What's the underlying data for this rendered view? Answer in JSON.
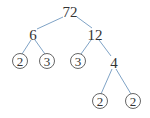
{
  "diagram": {
    "type": "factor-tree",
    "colors": {
      "edge": "#7fa3c6",
      "text": "#333333",
      "circle_stroke": "#555555"
    },
    "nodes": [
      {
        "id": "n72",
        "label": "72",
        "x": 70,
        "y": 11,
        "circled": false
      },
      {
        "id": "n6",
        "label": "6",
        "x": 33,
        "y": 34,
        "circled": false
      },
      {
        "id": "n12",
        "label": "12",
        "x": 95,
        "y": 34,
        "circled": false
      },
      {
        "id": "n2a",
        "label": "2",
        "x": 20,
        "y": 61,
        "circled": true
      },
      {
        "id": "n3a",
        "label": "3",
        "x": 47,
        "y": 61,
        "circled": true
      },
      {
        "id": "n3b",
        "label": "3",
        "x": 78,
        "y": 61,
        "circled": true
      },
      {
        "id": "n4",
        "label": "4",
        "x": 114,
        "y": 62,
        "circled": false
      },
      {
        "id": "n2b",
        "label": "2",
        "x": 100,
        "y": 101,
        "circled": true
      },
      {
        "id": "n2c",
        "label": "2",
        "x": 133,
        "y": 101,
        "circled": true
      }
    ],
    "edges": [
      {
        "from": "n72",
        "to": "n6",
        "x1": 63,
        "y1": 17,
        "x2": 37,
        "y2": 29
      },
      {
        "from": "n72",
        "to": "n12",
        "x1": 77,
        "y1": 17,
        "x2": 92,
        "y2": 28
      },
      {
        "from": "n6",
        "to": "n2a",
        "x1": 31,
        "y1": 40,
        "x2": 22,
        "y2": 54
      },
      {
        "from": "n6",
        "to": "n3a",
        "x1": 35,
        "y1": 40,
        "x2": 45,
        "y2": 54
      },
      {
        "from": "n12",
        "to": "n3b",
        "x1": 91,
        "y1": 40,
        "x2": 81,
        "y2": 54
      },
      {
        "from": "n12",
        "to": "n4",
        "x1": 99,
        "y1": 40,
        "x2": 111,
        "y2": 56
      },
      {
        "from": "n4",
        "to": "n2b",
        "x1": 112,
        "y1": 69,
        "x2": 101,
        "y2": 94
      },
      {
        "from": "n4",
        "to": "n2c",
        "x1": 116,
        "y1": 69,
        "x2": 131,
        "y2": 94
      }
    ]
  }
}
